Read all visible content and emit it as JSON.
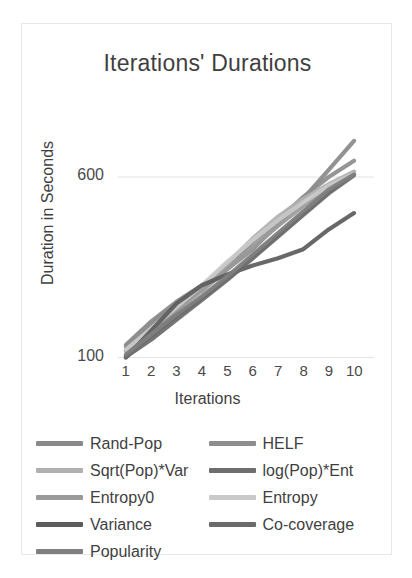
{
  "chart_data": {
    "type": "line",
    "title": "Iterations' Durations",
    "xlabel": "Iterations",
    "ylabel": "Duration in Seconds",
    "x": [
      1,
      2,
      3,
      4,
      5,
      6,
      7,
      8,
      9,
      10
    ],
    "categories": [
      "1",
      "2",
      "3",
      "4",
      "5",
      "6",
      "7",
      "8",
      "9",
      "10"
    ],
    "yticks": [
      100,
      600
    ],
    "ylim": [
      60,
      780
    ],
    "xlim": [
      1,
      10
    ],
    "grid": true,
    "legend_position": "bottom",
    "series": [
      {
        "name": "Rand-Pop",
        "color": "#8a8a8a",
        "values": [
          135,
          200,
          255,
          300,
          345,
          400,
          470,
          540,
          620,
          700
        ]
      },
      {
        "name": "HELF",
        "color": "#8d8d8d",
        "values": [
          130,
          195,
          250,
          295,
          350,
          420,
          480,
          545,
          600,
          645
        ]
      },
      {
        "name": "Sqrt(Pop)*Var",
        "color": "#b0b0b0",
        "values": [
          120,
          170,
          230,
          290,
          360,
          430,
          490,
          540,
          580,
          615
        ]
      },
      {
        "name": "log(Pop)*Ent",
        "color": "#6e6e6e",
        "values": [
          105,
          160,
          215,
          265,
          320,
          380,
          440,
          500,
          560,
          608
        ]
      },
      {
        "name": "Entropy0",
        "color": "#9a9a9a",
        "values": [
          118,
          175,
          235,
          285,
          345,
          405,
          465,
          520,
          570,
          612
        ]
      },
      {
        "name": "Entropy",
        "color": "#c9c9c9",
        "values": [
          122,
          180,
          240,
          300,
          365,
          425,
          480,
          530,
          575,
          610
        ]
      },
      {
        "name": "Variance",
        "color": "#5c5c5c",
        "values": [
          100,
          175,
          250,
          300,
          330,
          355,
          375,
          400,
          455,
          500
        ]
      },
      {
        "name": "Co-coverage",
        "color": "#6a6a6a",
        "values": [
          102,
          150,
          205,
          260,
          315,
          375,
          435,
          495,
          555,
          605
        ]
      },
      {
        "name": "Popularity",
        "color": "#7f7f7f",
        "values": [
          108,
          165,
          220,
          270,
          325,
          385,
          445,
          505,
          565,
          607
        ]
      }
    ]
  }
}
